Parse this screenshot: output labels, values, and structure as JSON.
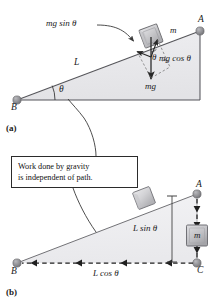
{
  "figure": {
    "panels": [
      {
        "tag": "(a)",
        "name": "panel-a"
      },
      {
        "tag": "(b)",
        "name": "panel-b"
      }
    ],
    "callout": {
      "line1": "Work done by gravity",
      "line2": "is independent of path."
    },
    "panel_a": {
      "vertex_b": "B",
      "vertex_a": "A",
      "length_label": "L",
      "angle_label": "θ",
      "angle_label_block": "θ",
      "mass_label": "m",
      "force_parallel": "mg sin θ",
      "force_perpendicular": "mg cos θ",
      "force_weight": "mg"
    },
    "panel_b": {
      "vertex_b": "B",
      "vertex_a": "A",
      "vertex_c": "C",
      "mass_label": "m",
      "vertical_label": "L sin θ",
      "horizontal_label": "L cos θ"
    }
  },
  "colors": {
    "ink": "#1a1a1a",
    "incline_fill": "#e9e9ec",
    "incline_fill_light": "#f2f2f4",
    "outline": "#5a5a5a",
    "node_dot": "#8a8a8a",
    "node_dot_dark": "#6e6e6e",
    "block_face": "#c9c9cc",
    "block_face_light": "#dcdcdf",
    "block_edge": "#6a6a6a",
    "dashed": "#2a2a2a",
    "callout_border": "#2b2b2b",
    "background": "#ffffff"
  }
}
